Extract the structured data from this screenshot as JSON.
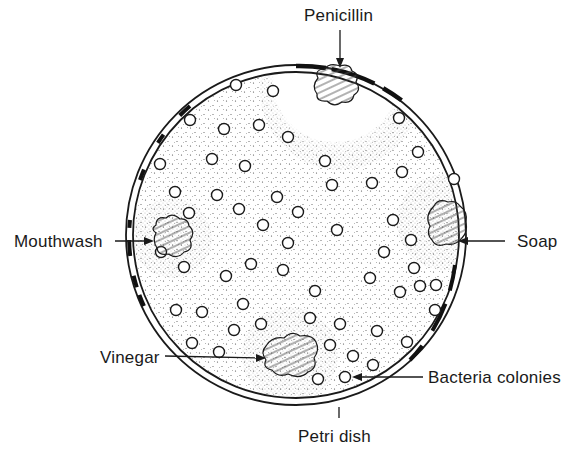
{
  "diagram": {
    "labels": {
      "penicillin": "Penicillin",
      "mouthwash": "Mouthwash",
      "soap": "Soap",
      "vinegar": "Vinegar",
      "bacteria_colonies": "Bacteria colonies",
      "petri_dish": "Petri dish"
    },
    "colors": {
      "ink": "#1a1a1a",
      "background": "#ffffff",
      "hatch": "#555555"
    },
    "dish": {
      "cx": 296,
      "cy": 235,
      "r": 170
    },
    "samples": [
      {
        "name": "Penicillin",
        "x": 340,
        "y": 88
      },
      {
        "name": "Mouthwash",
        "x": 172,
        "y": 238
      },
      {
        "name": "Soap",
        "x": 445,
        "y": 222
      },
      {
        "name": "Vinegar",
        "x": 290,
        "y": 355
      }
    ],
    "colony_count": 62
  }
}
